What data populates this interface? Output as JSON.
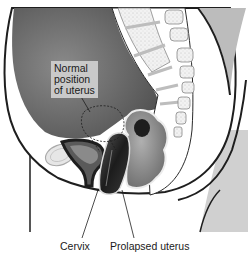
{
  "figure": {
    "labels": {
      "normal_position": [
        "Normal",
        "position",
        "of uterus"
      ],
      "cervix": "Cervix",
      "prolapsed_uterus": "Prolapsed uterus"
    },
    "colors": {
      "background": "#ffffff",
      "body_cavity": "#6e6e6e",
      "skin_outline": "#1e1e1e",
      "thigh_fill": "#d0d0d0",
      "bone_fill": "#efefef",
      "disc_fill": "#bdbdbd",
      "label_box": "#c9c9c9",
      "organ_dark": "#2c2c2c",
      "bowel": "#8a8a8a"
    }
  }
}
